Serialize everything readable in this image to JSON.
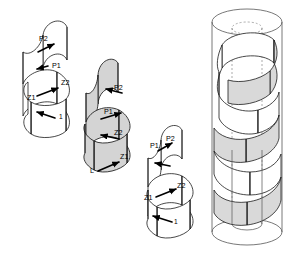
{
  "figure": {
    "background_color": "#ffffff",
    "line_color": "#1a1a1a",
    "gray_fill": "#d9d9d9",
    "white_fill": "#ffffff",
    "cylinder_stroke": "#555555"
  },
  "panels": [
    {
      "id": "panel-1",
      "name": "left-helix",
      "fill": "white",
      "turns": 3,
      "labels": [
        {
          "text": "P2",
          "x": 39,
          "y": 41
        },
        {
          "text": "P1",
          "x": 52,
          "y": 68
        },
        {
          "text": "Z2",
          "x": 61,
          "y": 85
        },
        {
          "text": "Z1",
          "x": 31,
          "y": 99
        },
        {
          "text": "1",
          "x": 59,
          "y": 118
        }
      ],
      "vectors": [
        {
          "name": "p2-vector",
          "x1": 38,
          "y1": 52,
          "x2": 54,
          "y2": 44,
          "head": "end"
        },
        {
          "name": "p1-vector",
          "x1": 48,
          "y1": 66,
          "x2": 39,
          "y2": 69,
          "head": "end"
        },
        {
          "name": "z2-vector",
          "x1": 39,
          "y1": 96,
          "x2": 58,
          "y2": 88,
          "head": "end"
        },
        {
          "name": "1-vector",
          "x1": 55,
          "y1": 118,
          "x2": 37,
          "y2": 113,
          "head": "end"
        }
      ]
    },
    {
      "id": "panel-2",
      "name": "middle-helix",
      "fill": "gray",
      "turns": 3,
      "labels": [
        {
          "text": "P2",
          "x": 116,
          "y": 89
        },
        {
          "text": "P1",
          "x": 107,
          "y": 113
        },
        {
          "text": "Z2",
          "x": 116,
          "y": 134
        },
        {
          "text": "Z1",
          "x": 121,
          "y": 159
        },
        {
          "text": "L",
          "x": 92,
          "y": 172
        }
      ],
      "vectors": [
        {
          "name": "p2-vector",
          "x1": 122,
          "y1": 92,
          "x2": 104,
          "y2": 89,
          "head": "end"
        },
        {
          "name": "p1-vector",
          "x1": 103,
          "y1": 118,
          "x2": 121,
          "y2": 113,
          "head": "end"
        },
        {
          "name": "z2-vector",
          "x1": 119,
          "y1": 138,
          "x2": 101,
          "y2": 135,
          "head": "end"
        },
        {
          "name": "z1-vector",
          "x1": 98,
          "y1": 171,
          "x2": 119,
          "y2": 161,
          "head": "end"
        }
      ]
    },
    {
      "id": "panel-3",
      "name": "right-helix",
      "fill": "white",
      "turns": 3,
      "labels": [
        {
          "text": "P1",
          "x": 155,
          "y": 146
        },
        {
          "text": "P2",
          "x": 169,
          "y": 140
        },
        {
          "text": "Z2",
          "x": 178,
          "y": 187
        },
        {
          "text": "Z1",
          "x": 148,
          "y": 199
        },
        {
          "text": "1",
          "x": 174,
          "y": 223
        }
      ],
      "vectors": [
        {
          "name": "p2-vector",
          "x1": 158,
          "y1": 150,
          "x2": 173,
          "y2": 142,
          "head": "end"
        },
        {
          "name": "p1-vector",
          "x1": 168,
          "y1": 165,
          "x2": 155,
          "y2": 163,
          "head": "end"
        },
        {
          "name": "z2-vector",
          "x1": 156,
          "y1": 196,
          "x2": 175,
          "y2": 188,
          "head": "end"
        },
        {
          "name": "1-vector",
          "x1": 170,
          "y1": 222,
          "x2": 152,
          "y2": 217,
          "head": "end"
        }
      ]
    },
    {
      "id": "panel-4",
      "name": "cylinder-assembly",
      "fill": "mixed",
      "description": "interleaved white and gray helical ribbons inside a transparent cylinder with an inner core",
      "labels": [],
      "vectors": []
    }
  ]
}
